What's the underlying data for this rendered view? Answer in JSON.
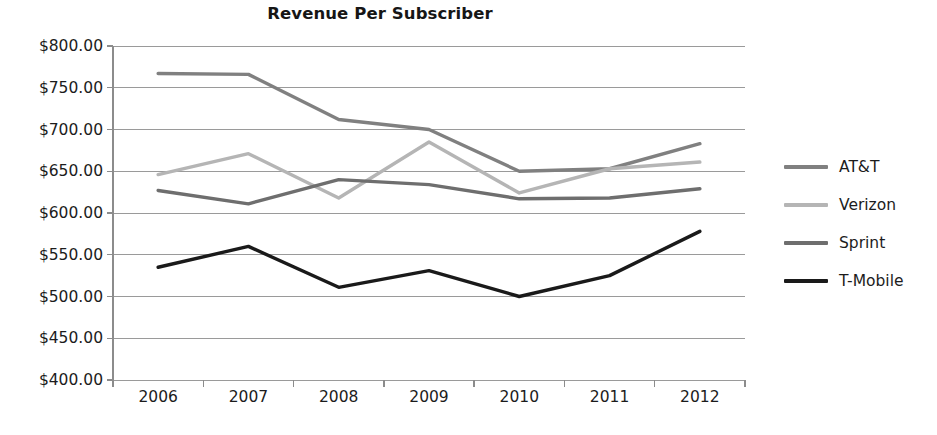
{
  "chart_data": {
    "type": "line",
    "title": "Revenue Per Subscriber",
    "xlabel": "",
    "ylabel": "",
    "categories": [
      "2006",
      "2007",
      "2008",
      "2009",
      "2010",
      "2011",
      "2012"
    ],
    "x": [
      2006,
      2007,
      2008,
      2009,
      2010,
      2011,
      2012
    ],
    "ylim": [
      400,
      800
    ],
    "ytick_step": 50,
    "ytick_values": [
      800,
      750,
      700,
      650,
      600,
      550,
      500,
      450,
      400
    ],
    "ytick_labels": [
      "$800.00",
      "$750.00",
      "$700.00",
      "$650.00",
      "$600.00",
      "$550.00",
      "$500.00",
      "$450.00",
      "$400.00"
    ],
    "grid": true,
    "grid_axis": "y",
    "legend_position": "right",
    "value_prefix": "$",
    "series": [
      {
        "name": "AT&T",
        "color": "#808080",
        "values": [
          767,
          766,
          712,
          700,
          650,
          653,
          683
        ]
      },
      {
        "name": "Verizon",
        "color": "#b5b5b5",
        "values": [
          646,
          671,
          618,
          685,
          624,
          653,
          661
        ]
      },
      {
        "name": "Sprint",
        "color": "#6e6e6e",
        "values": [
          627,
          611,
          640,
          634,
          617,
          618,
          629
        ]
      },
      {
        "name": "T-Mobile",
        "color": "#1a1a1a",
        "values": [
          535,
          560,
          511,
          531,
          500,
          525,
          578
        ]
      }
    ]
  },
  "legend": {
    "items": [
      {
        "label": "AT&T",
        "color": "#808080"
      },
      {
        "label": "Verizon",
        "color": "#b5b5b5"
      },
      {
        "label": "Sprint",
        "color": "#6e6e6e"
      },
      {
        "label": "T-Mobile",
        "color": "#1a1a1a"
      }
    ]
  },
  "style": {
    "grid_color": "#9a9a9a",
    "axis_color": "#8c8c8c",
    "background": "#ffffff",
    "line_width": 3.4
  }
}
